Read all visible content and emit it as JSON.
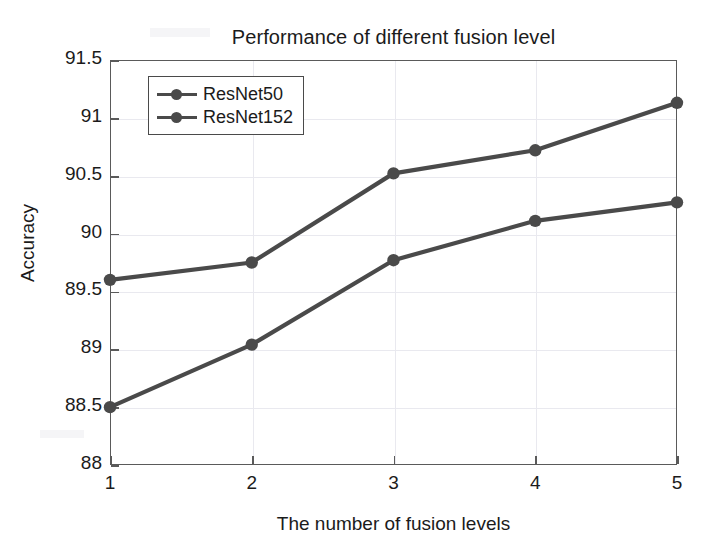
{
  "chart_data": {
    "type": "line",
    "title": "Performance of different fusion level",
    "xlabel": "The number of fusion levels",
    "ylabel": "Accuracy",
    "x": [
      1,
      2,
      3,
      4,
      5
    ],
    "xticklabels": [
      "1",
      "2",
      "3",
      "4",
      "5"
    ],
    "yticks": [
      88,
      88.5,
      89,
      89.5,
      90,
      90.5,
      91,
      91.5
    ],
    "yticklabels": [
      "88",
      "88.5",
      "89",
      "89.5",
      "90",
      "90.5",
      "91",
      "91.5"
    ],
    "xlim": [
      1,
      5
    ],
    "ylim": [
      88,
      91.5
    ],
    "grid": true,
    "legend_position": "upper left",
    "series": [
      {
        "name": "ResNet50",
        "values": [
          88.5,
          89.04,
          89.77,
          90.11,
          90.27
        ],
        "color": "#4a4a4a",
        "marker": "circle"
      },
      {
        "name": "ResNet152",
        "values": [
          89.6,
          89.75,
          90.52,
          90.72,
          91.13
        ],
        "color": "#4a4a4a",
        "marker": "circle"
      }
    ]
  },
  "legend": {
    "entries": [
      {
        "label": "ResNet50"
      },
      {
        "label": "ResNet152"
      }
    ]
  },
  "style": {
    "line_color": "#4a4a4a",
    "axis_color": "#5a5a5a",
    "grid_color": "#e9e9ef",
    "text_color": "#1b1b1b",
    "background": "#ffffff"
  }
}
